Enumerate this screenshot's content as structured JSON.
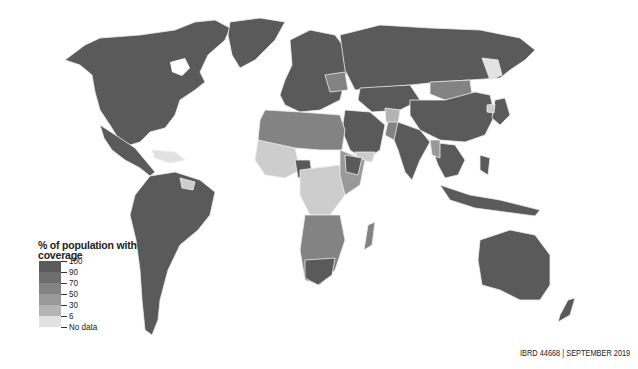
{
  "map": {
    "title": "",
    "legend": {
      "title_line1": "% of population with",
      "title_line2": "coverage",
      "bins": [
        {
          "label": "100",
          "color": "#5a5a5a"
        },
        {
          "label": "90",
          "color": "#6e6e6e"
        },
        {
          "label": "70",
          "color": "#838383"
        },
        {
          "label": "50",
          "color": "#999999"
        },
        {
          "label": "30",
          "color": "#b4b4b4"
        },
        {
          "label": "6",
          "color": "#cdcdcd"
        },
        {
          "label": "No data",
          "color": "#e2e2e2"
        }
      ]
    },
    "credit": "IBRD 44668 | SEPTEMBER 2019",
    "colors": {
      "land_high": "#5a5a5a",
      "land_mid": "#838383",
      "land_low": "#b4b4b4",
      "land_lowest": "#cdcdcd",
      "no_data": "#e2e2e2",
      "border": "#eeeeee",
      "ocean": "#ffffff"
    }
  }
}
